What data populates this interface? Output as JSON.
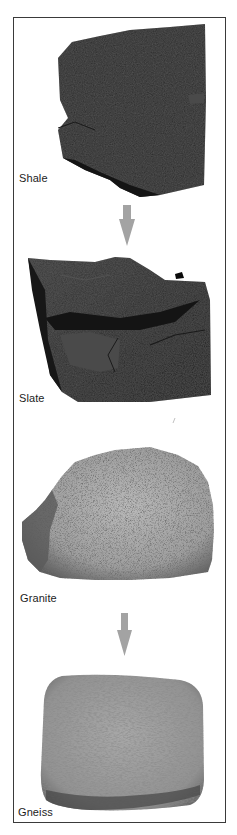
{
  "figure": {
    "colors": {
      "frame": "#3a3a3a",
      "arrow": "#a3a3a3",
      "background": "#ffffff"
    },
    "panels": [
      {
        "id": "shale",
        "label": "Shale",
        "rock_type": "sedimentary",
        "tone": "dark-gray"
      },
      {
        "id": "slate",
        "label": "Slate",
        "rock_type": "metamorphic",
        "tone": "dark-gray"
      },
      {
        "id": "granite",
        "label": "Granite",
        "rock_type": "igneous",
        "tone": "speckled-light-gray"
      },
      {
        "id": "gneiss",
        "label": "Gneiss",
        "rock_type": "metamorphic",
        "tone": "banded-light-gray"
      }
    ],
    "transformations": [
      {
        "from": "Shale",
        "to": "Slate",
        "icon": "down-arrow-icon"
      },
      {
        "from": "Granite",
        "to": "Gneiss",
        "icon": "down-arrow-icon"
      }
    ]
  }
}
